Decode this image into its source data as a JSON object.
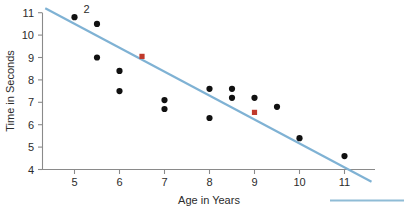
{
  "chart_data": {
    "type": "scatter",
    "title": "",
    "xlabel": "Age in Years",
    "ylabel": "Time in Seconds",
    "xlim": [
      4.3,
      11.7
    ],
    "ylim": [
      4,
      11.35
    ],
    "xticks": [
      5,
      6,
      7,
      8,
      9,
      10,
      11
    ],
    "yticks": [
      4,
      5,
      6,
      7,
      8,
      9,
      10,
      11
    ],
    "grid": false,
    "legend": "none",
    "series": [
      {
        "name": "data-points",
        "color": "#111111",
        "points": [
          {
            "x": 5.0,
            "y": 10.8
          },
          {
            "x": 5.5,
            "y": 10.5
          },
          {
            "x": 5.5,
            "y": 9.0
          },
          {
            "x": 6.0,
            "y": 8.4
          },
          {
            "x": 6.0,
            "y": 7.5
          },
          {
            "x": 7.0,
            "y": 7.1
          },
          {
            "x": 7.0,
            "y": 6.7
          },
          {
            "x": 8.0,
            "y": 6.3
          },
          {
            "x": 8.0,
            "y": 7.6
          },
          {
            "x": 8.5,
            "y": 7.2
          },
          {
            "x": 8.5,
            "y": 7.6
          },
          {
            "x": 9.0,
            "y": 7.2
          },
          {
            "x": 9.5,
            "y": 6.8
          },
          {
            "x": 10.0,
            "y": 5.4
          },
          {
            "x": 11.0,
            "y": 4.6
          }
        ]
      },
      {
        "name": "highlighted-points",
        "color": "#c0392b",
        "points": [
          {
            "x": 6.5,
            "y": 9.05
          },
          {
            "x": 9.0,
            "y": 6.55
          }
        ]
      }
    ],
    "trend_line": {
      "name": "line-of-best-fit",
      "color": "#7fb2d4",
      "x_start": 4.35,
      "y_start": 11.2,
      "x_end": 11.6,
      "y_end": 3.45
    },
    "annotations": [
      {
        "text": "2",
        "x": 5.2,
        "y": 11.0
      }
    ]
  },
  "axes": {
    "x_tick_labels": [
      "5",
      "6",
      "7",
      "8",
      "9",
      "10",
      "11"
    ],
    "y_tick_labels": [
      "4",
      "5",
      "6",
      "7",
      "8",
      "9",
      "10",
      "11"
    ],
    "x_axis_title": "Age in Years",
    "y_axis_title": "Time in Seconds"
  },
  "footer": {
    "rule_color": "#8fbcd6"
  }
}
